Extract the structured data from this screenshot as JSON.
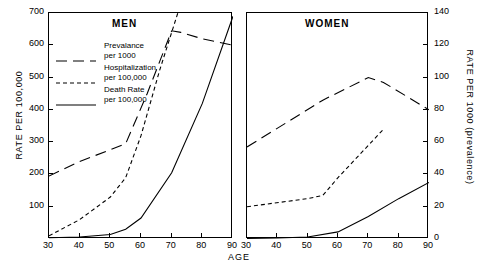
{
  "chart_data": {
    "type": "line",
    "title": "",
    "xlabel": "AGE",
    "ylabel": "RATE PER 100,000",
    "ylabel_right": "RATE PER 1000 (prevalence)",
    "xlim": [
      30,
      90
    ],
    "ylim": [
      0,
      700
    ],
    "ylim_right": [
      0,
      140
    ],
    "xticks": [
      30,
      40,
      50,
      60,
      70,
      80,
      90
    ],
    "yticks_left": [
      100,
      200,
      300,
      400,
      500,
      600,
      700
    ],
    "yticks_right": [
      0,
      20,
      40,
      60,
      80,
      100,
      120,
      140
    ],
    "grid": false,
    "legend_position": "upper-left-inside-men-panel",
    "panels": [
      {
        "name": "MEN",
        "title": "MEN",
        "series": [
          {
            "name": "Prevalance per 1000",
            "axis": "right",
            "style": "long-dash",
            "x": [
              30,
              40,
              55,
              62,
              70,
              73,
              80,
              90
            ],
            "values_left_scale": [
              195,
              240,
              295,
              450,
              645,
              640,
              620,
              600
            ],
            "values": [
              39,
              48,
              59,
              90,
              129,
              128,
              124,
              120
            ]
          },
          {
            "name": "Hospitalization per 100,000",
            "axis": "left",
            "style": "short-dash",
            "x": [
              30,
              40,
              50,
              55,
              60,
              66,
              72
            ],
            "values": [
              10,
              60,
              130,
              190,
              320,
              520,
              700
            ]
          },
          {
            "name": "Death Rate per 100,000",
            "axis": "left",
            "style": "solid",
            "x": [
              30,
              40,
              50,
              55,
              60,
              70,
              80,
              90
            ],
            "values": [
              4,
              6,
              14,
              30,
              65,
              205,
              420,
              690
            ]
          }
        ]
      },
      {
        "name": "WOMEN",
        "title": "WOMEN",
        "series": [
          {
            "name": "Prevalance per 1000",
            "axis": "right",
            "style": "long-dash",
            "x": [
              30,
              55,
              70,
              75,
              90
            ],
            "values_left_scale": [
              285,
              430,
              500,
              485,
              400
            ],
            "values": [
              57,
              86,
              100,
              97,
              80
            ]
          },
          {
            "name": "Hospitalization per 100,000",
            "axis": "left",
            "style": "short-dash",
            "x": [
              30,
              50,
              55,
              60,
              70,
              75
            ],
            "values": [
              100,
              125,
              135,
              190,
              290,
              340
            ]
          },
          {
            "name": "Death Rate per 100,000",
            "axis": "left",
            "style": "solid",
            "x": [
              30,
              40,
              50,
              60,
              70,
              80,
              90
            ],
            "values": [
              2,
              3,
              6,
              22,
              70,
              125,
              175
            ]
          }
        ]
      }
    ],
    "legend": [
      {
        "label_line1": "Prevalance",
        "label_line2": "per 1000",
        "style": "long-dash"
      },
      {
        "label_line1": "Hospitalization",
        "label_line2": "per 100,000",
        "style": "short-dash"
      },
      {
        "label_line1": "Death Rate",
        "label_line2": "per 100,000",
        "style": "solid"
      }
    ]
  },
  "axes": {
    "left_title": "RATE PER 100,000",
    "right_title": "RATE PER  1000  (prevalence)",
    "x_title": "AGE",
    "left_ticks": [
      "700",
      "600",
      "500",
      "400",
      "300",
      "200",
      "100"
    ],
    "right_ticks": [
      "140",
      "120",
      "100",
      "80",
      "60",
      "40",
      "20",
      "0"
    ],
    "x_ticks_men": [
      "30",
      "40",
      "50",
      "60",
      "70",
      "80",
      "90"
    ],
    "x_ticks_women": [
      "30",
      "40",
      "50",
      "60",
      "70",
      "80",
      "90"
    ]
  },
  "panels": {
    "men_title": "MEN",
    "women_title": "WOMEN"
  },
  "colors": {
    "line": "#000000",
    "background": "#ffffff"
  }
}
